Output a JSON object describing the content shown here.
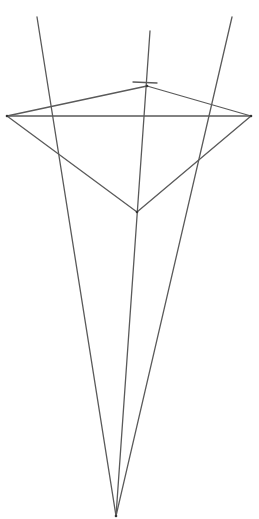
{
  "diagram": {
    "type": "geometric-construction",
    "stroke_color": "#5a5a5a",
    "point_color": "#333333",
    "background": "#ffffff",
    "points": {
      "apex": {
        "x": 116,
        "y": 516
      },
      "left_vertex": {
        "x": 7,
        "y": 116
      },
      "right_vertex": {
        "x": 251,
        "y": 116
      },
      "top_vertex": {
        "x": 147,
        "y": 86
      },
      "bottom_vertex": {
        "x": 137,
        "y": 212
      }
    },
    "rays": [
      {
        "name": "left-ray",
        "x1": 116,
        "y1": 516,
        "x2": 37,
        "y2": 17
      },
      {
        "name": "center-ray",
        "x1": 116,
        "y1": 516,
        "x2": 150,
        "y2": 31
      },
      {
        "name": "right-ray",
        "x1": 116,
        "y1": 516,
        "x2": 232,
        "y2": 17
      }
    ],
    "segments": [
      {
        "name": "horizontal-segment",
        "x1": 7,
        "y1": 116,
        "x2": 251,
        "y2": 116
      },
      {
        "name": "upper-left-edge",
        "x1": 7,
        "y1": 116,
        "x2": 147,
        "y2": 86
      },
      {
        "name": "upper-right-edge",
        "x1": 147,
        "y1": 86,
        "x2": 251,
        "y2": 116
      },
      {
        "name": "lower-left-edge",
        "x1": 7,
        "y1": 116,
        "x2": 137,
        "y2": 212
      },
      {
        "name": "lower-right-edge",
        "x1": 137,
        "y1": 212,
        "x2": 251,
        "y2": 116
      },
      {
        "name": "top-tick",
        "x1": 133,
        "y1": 82,
        "x2": 157,
        "y2": 83
      }
    ]
  }
}
